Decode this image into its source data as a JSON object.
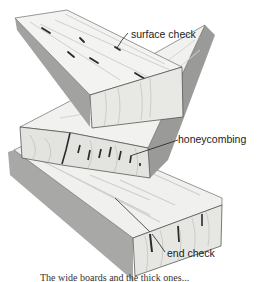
{
  "figure": {
    "labels": {
      "surface_check": "surface check",
      "honeycombing": "honeycombing",
      "end_check": "end check"
    },
    "caption": "The wide boards and the thick ones...",
    "colors": {
      "line": "#3a3a3a",
      "wood_light": "#f2f2f0",
      "wood_mid": "#d9d9d6",
      "wood_shadow": "#9c9c9a",
      "check_mark": "#2a2a2a",
      "label_text": "#222222"
    }
  }
}
